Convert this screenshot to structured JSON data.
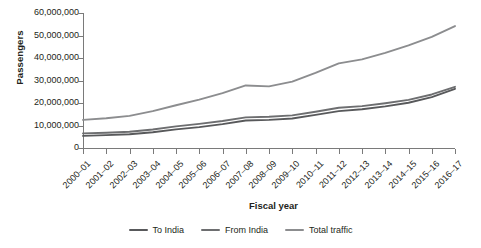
{
  "chart_data": {
    "type": "line",
    "title": "",
    "xlabel": "Fiscal year",
    "ylabel": "Passengers",
    "categories": [
      "2000–01",
      "2001–02",
      "2002–03",
      "2003–04",
      "2004–05",
      "2005–06",
      "2006–07",
      "2007–08",
      "2008–09",
      "2009–10",
      "2010–11",
      "2011–12",
      "2012–13",
      "2013–14",
      "2014–15",
      "2015–16",
      "2016–17"
    ],
    "ylim": [
      0,
      60000000
    ],
    "ytick_values": [
      0,
      10000000,
      20000000,
      30000000,
      40000000,
      50000000,
      60000000
    ],
    "ytick_labels": [
      "0",
      "10,000,000",
      "20,000,000",
      "30,000,000",
      "40,000,000",
      "50,000,000",
      "60,000,000"
    ],
    "grid": false,
    "legend_position": "bottom",
    "series": [
      {
        "name": "To India",
        "color": "#58595b",
        "values": [
          5400000,
          5700000,
          6100000,
          7000000,
          8300000,
          9300000,
          10600000,
          12200000,
          12500000,
          13100000,
          14700000,
          16400000,
          17200000,
          18500000,
          20100000,
          22600000,
          26300000
        ]
      },
      {
        "name": "From India",
        "color": "#6d6e70",
        "values": [
          6500000,
          6800000,
          7200000,
          8200000,
          9600000,
          10700000,
          12000000,
          13600000,
          13900000,
          14500000,
          16100000,
          17900000,
          18600000,
          19900000,
          21400000,
          23800000,
          27200000
        ]
      },
      {
        "name": "Total traffic",
        "color": "#8c8d8f",
        "values": [
          12500000,
          13200000,
          14300000,
          16400000,
          19000000,
          21500000,
          24400000,
          27800000,
          27400000,
          29500000,
          33400000,
          37600000,
          39400000,
          42300000,
          45600000,
          49400000,
          54200000
        ]
      }
    ]
  },
  "axis": {
    "y_title": "Passengers",
    "x_title": "Fiscal year"
  },
  "colors": {
    "axis": "#7a7a7a",
    "text": "#231f20",
    "background": "#ffffff"
  }
}
